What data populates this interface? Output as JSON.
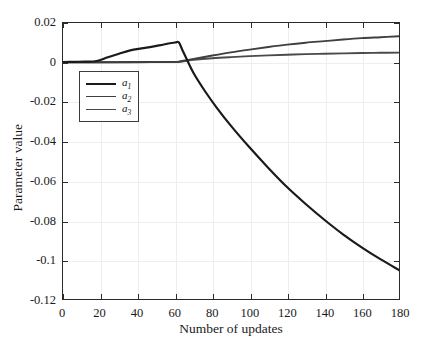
{
  "chart_data": {
    "type": "line",
    "title": "",
    "xlabel": "Number of updates",
    "ylabel": "Parameter value",
    "xlim": [
      0,
      180
    ],
    "ylim": [
      -0.12,
      0.02
    ],
    "xticks": [
      0,
      20,
      40,
      60,
      80,
      100,
      120,
      140,
      160,
      180
    ],
    "xticklabels": [
      "0",
      "20",
      "40",
      "60",
      "80",
      "100",
      "120",
      "140",
      "160",
      "180"
    ],
    "yticks": [
      0.02,
      0,
      -0.02,
      -0.04,
      -0.06,
      -0.08,
      -0.1,
      -0.12
    ],
    "yticklabels": [
      "0.02",
      "0",
      "-0.02",
      "-0.04",
      "-0.06",
      "-0.08",
      "-0.1",
      "-0.12"
    ],
    "grid": true,
    "legend_position": "upper-left-inside",
    "series": [
      {
        "name": "a1",
        "label": "a",
        "subscript": "1",
        "color": "#1a1a1a",
        "linewidth": 2.2,
        "x": [
          0,
          6,
          12,
          18,
          24,
          30,
          36,
          42,
          48,
          54,
          60,
          62,
          64,
          66,
          70,
          76,
          82,
          90,
          100,
          110,
          120,
          130,
          140,
          150,
          160,
          170,
          180
        ],
        "y": [
          0.0002,
          0.0003,
          0.0004,
          0.0007,
          0.0026,
          0.0044,
          0.0061,
          0.0071,
          0.008,
          0.0091,
          0.0101,
          0.0102,
          0.0062,
          0.0022,
          -0.0055,
          -0.0145,
          -0.0225,
          -0.0322,
          -0.0432,
          -0.0535,
          -0.0632,
          -0.0718,
          -0.0798,
          -0.0872,
          -0.0938,
          -0.0998,
          -0.1053
        ]
      },
      {
        "name": "a2",
        "label": "a",
        "subscript": "2",
        "color": "#3f3f3f",
        "linewidth": 1.9,
        "x": [
          0,
          20,
          40,
          60,
          62,
          66,
          70,
          80,
          90,
          100,
          110,
          120,
          130,
          140,
          150,
          160,
          170,
          180
        ],
        "y": [
          0.0001,
          0.0001,
          0.0002,
          0.0003,
          0.0004,
          0.0011,
          0.0018,
          0.0035,
          0.0051,
          0.0065,
          0.0078,
          0.009,
          0.01,
          0.0108,
          0.0116,
          0.0123,
          0.0128,
          0.0133
        ]
      },
      {
        "name": "a3",
        "label": "a",
        "subscript": "3",
        "color": "#4a4a4a",
        "linewidth": 1.9,
        "x": [
          0,
          20,
          40,
          60,
          62,
          66,
          70,
          80,
          90,
          100,
          110,
          120,
          130,
          140,
          150,
          160,
          170,
          180
        ],
        "y": [
          0.0001,
          0.0001,
          0.0001,
          0.0002,
          0.0003,
          0.0008,
          0.0013,
          0.0021,
          0.0027,
          0.0032,
          0.0036,
          0.0039,
          0.0042,
          0.0044,
          0.0046,
          0.0048,
          0.0049,
          0.005
        ]
      }
    ]
  },
  "axes": {
    "xlabel": "Number of updates",
    "ylabel": "Parameter value"
  },
  "legend": {
    "items": [
      {
        "label": "a",
        "sub": "1"
      },
      {
        "label": "a",
        "sub": "2"
      },
      {
        "label": "a",
        "sub": "3"
      }
    ]
  },
  "colors": {
    "axis": "#2b2b2b",
    "grid": "#eceef0",
    "background": "#ffffff",
    "series1": "#1a1a1a",
    "series2": "#3f3f3f",
    "series3": "#4a4a4a"
  }
}
